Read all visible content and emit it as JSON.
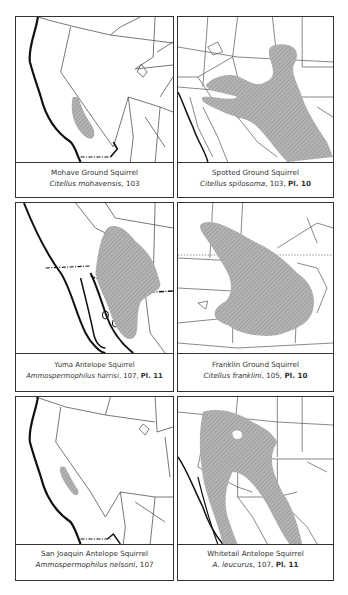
{
  "panels": [
    {
      "id": "mohave",
      "common_name": "Mohave Ground Squirrel",
      "scientific": "Citellus mohavensis",
      "page": ", 103",
      "plate": ""
    },
    {
      "id": "spotted",
      "common_name": "Spotted Ground Squirrel",
      "scientific": "Citellus spilosoma",
      "page": ", 103, ",
      "plate": "Pl. 10"
    },
    {
      "id": "yuma",
      "common_name": "Yuma Antelope Squirrel",
      "scientific": "Ammospermophilus harrisi",
      "page": ", 107, ",
      "plate": "Pl. 11"
    },
    {
      "id": "franklin",
      "common_name": "Franklin Ground Squirrel",
      "scientific": "Citellus franklini",
      "page": ", 105, ",
      "plate": "Pl. 10"
    },
    {
      "id": "sanjoaquin",
      "common_name": "San Joaquin Antelope Squirrel",
      "scientific": "Ammospermophilus nelsoni",
      "page": ", 107",
      "plate": ""
    },
    {
      "id": "whitetail",
      "common_name": "Whitetail Antelope Squirrel",
      "scientific": "A. leucurus",
      "page": ", 107, ",
      "plate": "Pl. 11"
    }
  ],
  "colors": {
    "range_fill": "#a9a9a9",
    "border": "#333333",
    "line": "#555555"
  }
}
